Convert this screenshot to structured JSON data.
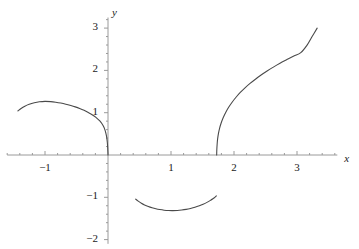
{
  "figure": {
    "background_color": "#ffffff",
    "curve_color": "#4a4a4a",
    "axis_color": "#9a9a9a",
    "text_color": "#1a1a1a"
  },
  "axes": {
    "x_axis_label": "x",
    "y_axis_label": "y",
    "x_ticks": [
      {
        "value": -1,
        "label": "−1"
      },
      {
        "value": 1,
        "label": "1"
      },
      {
        "value": 2,
        "label": "2"
      },
      {
        "value": 3,
        "label": "3"
      }
    ],
    "y_ticks": [
      {
        "value": 3,
        "label": "3"
      },
      {
        "value": 2,
        "label": "2"
      },
      {
        "value": 1,
        "label": "1"
      },
      {
        "value": -1,
        "label": "−1"
      },
      {
        "value": -2,
        "label": "−2"
      }
    ],
    "x_axis_range": [
      -1.6,
      3.64
    ],
    "y_axis_range": [
      -2.1,
      3.25
    ],
    "minor_ticks_visible": true,
    "grid": false
  },
  "chart_data": {
    "type": "line",
    "title": "",
    "xlabel": "x",
    "ylabel": "y",
    "xlim": [
      -1.6,
      3.64
    ],
    "ylim": [
      -2.1,
      3.25
    ],
    "grid": false,
    "legend": null,
    "series": [
      {
        "name": "left-arc",
        "comment": "descends from left endpoint over a rounded maximum then falls steeply to the origin",
        "points": [
          [
            -1.43,
            1.04
          ],
          [
            -1.38,
            1.1
          ],
          [
            -1.32,
            1.155
          ],
          [
            -1.25,
            1.2
          ],
          [
            -1.17,
            1.235
          ],
          [
            -1.09,
            1.258
          ],
          [
            -1.0,
            1.268
          ],
          [
            -0.91,
            1.262
          ],
          [
            -0.83,
            1.248
          ],
          [
            -0.75,
            1.228
          ],
          [
            -0.67,
            1.202
          ],
          [
            -0.59,
            1.17
          ],
          [
            -0.52,
            1.138
          ],
          [
            -0.45,
            1.1
          ],
          [
            -0.38,
            1.056
          ],
          [
            -0.32,
            1.012
          ],
          [
            -0.265,
            0.965
          ],
          [
            -0.215,
            0.915
          ],
          [
            -0.17,
            0.862
          ],
          [
            -0.13,
            0.805
          ],
          [
            -0.098,
            0.745
          ],
          [
            -0.072,
            0.68
          ],
          [
            -0.05,
            0.6
          ],
          [
            -0.033,
            0.51
          ],
          [
            -0.02,
            0.41
          ],
          [
            -0.011,
            0.3
          ],
          [
            -0.005,
            0.18
          ],
          [
            -0.001,
            0.06
          ],
          [
            0.0,
            0.0
          ]
        ]
      },
      {
        "name": "lower-arc",
        "comment": "concave-up arc entirely below the x-axis between roughly x = 0.44 and x = 1.72",
        "points": [
          [
            0.44,
            -1.045
          ],
          [
            0.48,
            -1.09
          ],
          [
            0.53,
            -1.14
          ],
          [
            0.58,
            -1.18
          ],
          [
            0.64,
            -1.218
          ],
          [
            0.7,
            -1.248
          ],
          [
            0.76,
            -1.272
          ],
          [
            0.82,
            -1.29
          ],
          [
            0.89,
            -1.305
          ],
          [
            0.96,
            -1.313
          ],
          [
            1.03,
            -1.315
          ],
          [
            1.1,
            -1.311
          ],
          [
            1.17,
            -1.301
          ],
          [
            1.24,
            -1.286
          ],
          [
            1.31,
            -1.264
          ],
          [
            1.38,
            -1.236
          ],
          [
            1.45,
            -1.2
          ],
          [
            1.51,
            -1.163
          ],
          [
            1.57,
            -1.12
          ],
          [
            1.62,
            -1.078
          ],
          [
            1.665,
            -1.035
          ],
          [
            1.7,
            -0.995
          ],
          [
            1.72,
            -0.965
          ]
        ]
      },
      {
        "name": "right-branch",
        "comment": "rises with a vertical tangent from the x-axis near x = 1.73 and climbs to about (3.32, 3.0)",
        "points": [
          [
            1.725,
            0.0
          ],
          [
            1.727,
            0.12
          ],
          [
            1.732,
            0.25
          ],
          [
            1.74,
            0.38
          ],
          [
            1.752,
            0.5
          ],
          [
            1.77,
            0.625
          ],
          [
            1.795,
            0.75
          ],
          [
            1.828,
            0.88
          ],
          [
            1.868,
            1.005
          ],
          [
            1.915,
            1.128
          ],
          [
            1.97,
            1.248
          ],
          [
            2.032,
            1.365
          ],
          [
            2.1,
            1.478
          ],
          [
            2.175,
            1.588
          ],
          [
            2.255,
            1.692
          ],
          [
            2.34,
            1.792
          ],
          [
            2.43,
            1.89
          ],
          [
            2.525,
            1.985
          ],
          [
            2.625,
            2.078
          ],
          [
            2.73,
            2.168
          ],
          [
            2.84,
            2.255
          ],
          [
            2.95,
            2.34
          ],
          [
            3.06,
            2.42
          ],
          [
            3.16,
            2.598
          ],
          [
            3.24,
            2.8
          ],
          [
            3.32,
            3.0
          ]
        ]
      }
    ]
  }
}
